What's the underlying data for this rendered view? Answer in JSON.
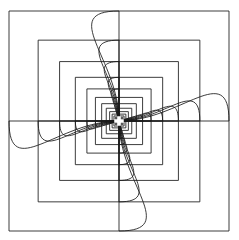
{
  "figure": {
    "type": "line-drawing",
    "canvas": {
      "width": 239,
      "height": 240,
      "background_color": "#ffffff"
    },
    "stroke": {
      "color": "#1a1a1a",
      "width": 0.85
    },
    "center": {
      "x": 119.0,
      "y": 121.0,
      "marker": "white-cross",
      "marker_size": 9.5
    },
    "bounds": {
      "left": 11,
      "top": 9,
      "right": 228,
      "bottom": 232
    },
    "symmetry": {
      "order": 4,
      "rotation_step_degrees": 90,
      "arm_labels": [
        "arm-top-left",
        "arm-top-right",
        "arm-bottom-right",
        "arm-bottom-left"
      ]
    },
    "nesting": {
      "ring_count": 14,
      "scale_ratio": 0.735,
      "largest_half_extent": 110.0,
      "twist_per_ring_degrees": 0.0
    },
    "arc": {
      "shape": "quarter-arc",
      "sweep": "inward-to-centre",
      "curvature_bias": 0.56
    }
  },
  "chart_data": {
    "type": "line",
    "xlabel": "",
    "ylabel": "",
    "xlim": [
      0,
      239
    ],
    "ylim": [
      0,
      240
    ],
    "grid": false,
    "legend": "none",
    "series": [
      {
        "name": "ring-01",
        "half_extent": 110.0,
        "arm_count": 4
      },
      {
        "name": "ring-02",
        "half_extent": 80.85,
        "arm_count": 4
      },
      {
        "name": "ring-03",
        "half_extent": 59.42,
        "arm_count": 4
      },
      {
        "name": "ring-04",
        "half_extent": 43.67,
        "arm_count": 4
      },
      {
        "name": "ring-05",
        "half_extent": 32.1,
        "arm_count": 4
      },
      {
        "name": "ring-06",
        "half_extent": 23.59,
        "arm_count": 4
      },
      {
        "name": "ring-07",
        "half_extent": 17.34,
        "arm_count": 4
      },
      {
        "name": "ring-08",
        "half_extent": 12.75,
        "arm_count": 4
      },
      {
        "name": "ring-09",
        "half_extent": 9.37,
        "arm_count": 4
      },
      {
        "name": "ring-10",
        "half_extent": 6.89,
        "arm_count": 4
      },
      {
        "name": "ring-11",
        "half_extent": 5.06,
        "arm_count": 4
      },
      {
        "name": "ring-12",
        "half_extent": 3.72,
        "arm_count": 4
      },
      {
        "name": "ring-13",
        "half_extent": 2.74,
        "arm_count": 4
      },
      {
        "name": "ring-14",
        "half_extent": 2.01,
        "arm_count": 4
      }
    ]
  }
}
